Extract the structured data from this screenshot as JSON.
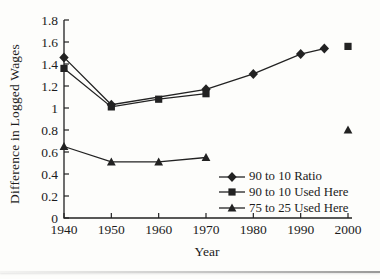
{
  "page": {
    "background": "#fdfdfb",
    "ink": "#1c1c1c",
    "line_color": "#222222"
  },
  "chart_data": {
    "type": "line",
    "title": "",
    "xlabel": "Year",
    "ylabel": "Difference in Logged Wages",
    "xlim": [
      1940,
      2000
    ],
    "ylim": [
      0,
      1.8
    ],
    "xticks": [
      1940,
      1950,
      1960,
      1970,
      1980,
      1990,
      2000
    ],
    "yticks": [
      0,
      0.2,
      0.4,
      0.6,
      0.8,
      1,
      1.2,
      1.4,
      1.6,
      1.8
    ],
    "ytick_labels": [
      "0",
      "0.2",
      "0.4",
      "0.6",
      "0.8",
      "1",
      "1.2",
      "1.4",
      "1.6",
      "1.8"
    ],
    "grid": false,
    "legend_position": "inside-bottom-right",
    "series": [
      {
        "name": "90 to 10 Ratio",
        "marker": "diamond",
        "connected": true,
        "points": [
          {
            "x": 1940,
            "y": 1.46
          },
          {
            "x": 1950,
            "y": 1.03
          },
          {
            "x": 1970,
            "y": 1.17
          },
          {
            "x": 1980,
            "y": 1.31
          },
          {
            "x": 1990,
            "y": 1.49
          },
          {
            "x": 1995,
            "y": 1.54
          }
        ],
        "isolated_points": []
      },
      {
        "name": "90 to 10 Used Here",
        "marker": "square",
        "connected": true,
        "points": [
          {
            "x": 1940,
            "y": 1.36
          },
          {
            "x": 1950,
            "y": 1.01
          },
          {
            "x": 1960,
            "y": 1.08
          },
          {
            "x": 1970,
            "y": 1.13
          }
        ],
        "isolated_points": [
          {
            "x": 2000,
            "y": 1.56
          }
        ]
      },
      {
        "name": "75 to 25 Used Here",
        "marker": "triangle",
        "connected": true,
        "points": [
          {
            "x": 1940,
            "y": 0.65
          },
          {
            "x": 1950,
            "y": 0.51
          },
          {
            "x": 1960,
            "y": 0.51
          },
          {
            "x": 1970,
            "y": 0.55
          }
        ],
        "isolated_points": [
          {
            "x": 2000,
            "y": 0.8
          }
        ]
      }
    ]
  }
}
